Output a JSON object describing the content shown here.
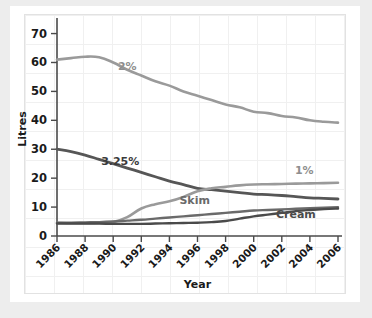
{
  "chart_data": {
    "type": "line",
    "title": "",
    "xlabel": "Year",
    "ylabel": "Litres",
    "x": [
      1986,
      1987,
      1988,
      1989,
      1990,
      1991,
      1992,
      1993,
      1994,
      1995,
      1996,
      1997,
      1998,
      1999,
      2000,
      2001,
      2002,
      2003,
      2004,
      2005,
      2006
    ],
    "xtick_labels": [
      "1986",
      "1988",
      "1990",
      "1992",
      "1994",
      "1996",
      "1998",
      "2000",
      "2002",
      "2004",
      "2006"
    ],
    "xtick_values": [
      1986,
      1988,
      1990,
      1992,
      1994,
      1996,
      1998,
      2000,
      2002,
      2004,
      2006
    ],
    "ytick_labels": [
      "0",
      "10",
      "20",
      "30",
      "40",
      "50",
      "60",
      "70"
    ],
    "ytick_values": [
      0,
      10,
      20,
      30,
      40,
      50,
      60,
      70
    ],
    "xlim": [
      1986,
      2006
    ],
    "ylim": [
      0,
      74
    ],
    "grid": true,
    "legend_position": "inline-annotations",
    "series": [
      {
        "name": "2%",
        "label": "2%",
        "color": "#9a9a9a",
        "values": [
          61.0,
          61.5,
          62.0,
          61.8,
          60.0,
          57.5,
          55.5,
          53.5,
          52.0,
          50.0,
          48.5,
          47.0,
          45.5,
          44.5,
          43.0,
          42.5,
          41.5,
          41.0,
          40.0,
          39.5,
          39.2
        ]
      },
      {
        "name": "3.25%",
        "label": "3.25%",
        "color": "#565656",
        "values": [
          30.0,
          29.2,
          28.0,
          26.5,
          25.0,
          23.5,
          22.0,
          20.5,
          19.0,
          17.8,
          16.5,
          16.0,
          15.5,
          15.0,
          14.5,
          14.3,
          14.0,
          13.6,
          13.2,
          13.0,
          12.8
        ]
      },
      {
        "name": "1%",
        "label": "1%",
        "color": "#9a9a9a",
        "values": [
          4.5,
          4.4,
          4.4,
          4.5,
          4.8,
          6.5,
          9.5,
          11.0,
          12.0,
          13.5,
          15.5,
          16.5,
          17.0,
          17.5,
          17.8,
          17.9,
          18.0,
          18.1,
          18.2,
          18.3,
          18.4
        ]
      },
      {
        "name": "Skim",
        "label": "Skim",
        "color": "#6a6a6a",
        "values": [
          4.6,
          4.6,
          4.7,
          4.8,
          5.0,
          5.3,
          5.6,
          6.0,
          6.4,
          6.8,
          7.2,
          7.6,
          8.0,
          8.4,
          8.8,
          9.0,
          9.2,
          9.4,
          9.6,
          9.8,
          10.0
        ]
      },
      {
        "name": "Cream",
        "label": "Cream",
        "color": "#4a4a4a",
        "values": [
          4.3,
          4.3,
          4.3,
          4.3,
          4.2,
          4.2,
          4.2,
          4.3,
          4.4,
          4.5,
          4.6,
          4.8,
          5.2,
          6.0,
          6.8,
          7.4,
          8.0,
          8.6,
          9.0,
          9.3,
          9.5
        ]
      }
    ],
    "annotations": [
      {
        "name": "2%",
        "text": "2%",
        "x": 1991.0,
        "y": 57.5,
        "color": "#8e8e8e"
      },
      {
        "name": "3.25%",
        "text": "3.25%",
        "x": 1990.5,
        "y": 24.5,
        "color": "#3a3a3a"
      },
      {
        "name": "Skim",
        "text": "Skim",
        "x": 1995.8,
        "y": 11.0,
        "color": "#6a6a6a"
      },
      {
        "name": "1%",
        "text": "1%",
        "x": 2003.6,
        "y": 21.5,
        "color": "#8e8e8e"
      },
      {
        "name": "Cream",
        "text": "Cream",
        "x": 2003.0,
        "y": 6.2,
        "color": "#4a4a4a"
      }
    ]
  }
}
